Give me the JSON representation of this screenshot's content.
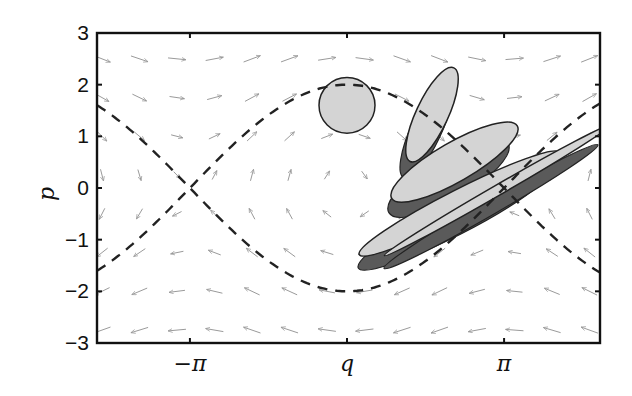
{
  "chart_data": {
    "type": "scatter",
    "title": "",
    "subtitle": "Pendulum phase portrait with evolving phase-space ellipses",
    "xlabel": "q",
    "ylabel": "p",
    "xlim": [
      -5.0,
      5.06
    ],
    "ylim": [
      -3,
      3
    ],
    "grid": false,
    "legend": null,
    "x_ticks": [
      {
        "value": -3.14159,
        "label": "−π"
      },
      {
        "value": 0,
        "label": "q"
      },
      {
        "value": 3.14159,
        "label": "π"
      }
    ],
    "y_ticks": [
      {
        "value": 3,
        "label": "3"
      },
      {
        "value": 2,
        "label": "2"
      },
      {
        "value": 1,
        "label": "1"
      },
      {
        "value": 0,
        "label": "0"
      },
      {
        "value": -1,
        "label": "−1"
      },
      {
        "value": -2,
        "label": "−2"
      },
      {
        "value": -3,
        "label": "−3"
      }
    ],
    "separatrix": {
      "style": "dashed",
      "color": "#222222",
      "upper": "p = 2 cos(q/2)",
      "lower": "p = -2 cos(q/2)",
      "sample_x": [
        -5,
        -4,
        -3.14,
        -2,
        -1,
        0,
        1,
        2,
        3.14,
        4,
        5
      ],
      "sample_upper": [
        -1.6,
        -0.83,
        0,
        1.08,
        1.76,
        2.0,
        1.76,
        1.08,
        0,
        -0.83,
        -1.6
      ],
      "sample_lower": [
        1.6,
        0.83,
        0,
        -1.08,
        -1.76,
        -2.0,
        -1.76,
        -1.08,
        0,
        0.83,
        1.6
      ]
    },
    "vector_field": {
      "type": "quiver",
      "color": "#9a9a9a",
      "equations": "dq/dt = p, dp/dt = -sin(q)",
      "grid_x_step": 0.5,
      "grid_y_step": 0.5
    },
    "ellipses": [
      {
        "cx": 0.0,
        "cy": 1.6,
        "rx": 0.56,
        "ry": 0.54,
        "angle_deg": 0,
        "fill": "#d4d4d4",
        "shadow": false
      },
      {
        "cx": 1.7,
        "cy": 1.42,
        "rx": 0.32,
        "ry": 1.0,
        "angle_deg": 25,
        "fill": "#d4d4d4",
        "shadow": true
      },
      {
        "cx": 2.15,
        "cy": 0.5,
        "rx": 1.45,
        "ry": 0.38,
        "angle_deg": -30,
        "fill": "#d4d4d4",
        "shadow": true
      },
      {
        "cx": 2.25,
        "cy": -0.3,
        "rx": 2.25,
        "ry": 0.27,
        "angle_deg": -27,
        "fill": "#d4d4d4",
        "shadow": true
      },
      {
        "cx": 3.0,
        "cy": -0.05,
        "rx": 2.6,
        "ry": 0.1,
        "angle_deg": -30,
        "fill": "#d4d4d4",
        "shadow": true
      }
    ],
    "colors": {
      "ellipse_fill": "#d4d4d4",
      "shadow_fill": "#5a5a5a",
      "outline": "#222222",
      "axes": "#111111",
      "arrows": "#9a9a9a",
      "separatrix": "#222222"
    }
  }
}
